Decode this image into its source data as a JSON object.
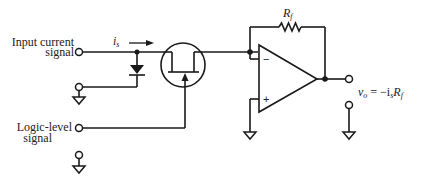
{
  "diagram": {
    "title": "",
    "labels": {
      "input_line1": "Input current",
      "input_line2": "signal",
      "logic_line1": "Logic-level",
      "logic_line2": "signal",
      "current_symbol": "i",
      "current_subscript": "s",
      "feedback_resistor": "R",
      "feedback_resistor_subscript": "f",
      "output_equation": "v",
      "output_equation_sub": "o",
      "output_equation_rhs": " = −i",
      "output_equation_rhs_sub": "s",
      "output_equation_R": "R",
      "output_equation_R_sub": "f",
      "opamp_minus": "−",
      "opamp_plus": "+"
    },
    "components": [
      {
        "id": "input-terminal",
        "type": "terminal"
      },
      {
        "id": "protection-diode",
        "type": "diode"
      },
      {
        "id": "jfet-switch",
        "type": "jfet"
      },
      {
        "id": "logic-terminal",
        "type": "terminal"
      },
      {
        "id": "op-amp",
        "type": "operational-amplifier"
      },
      {
        "id": "feedback-resistor",
        "type": "resistor"
      },
      {
        "id": "output-terminal",
        "type": "terminal"
      },
      {
        "id": "ground",
        "type": "ground",
        "count": 4
      }
    ]
  }
}
